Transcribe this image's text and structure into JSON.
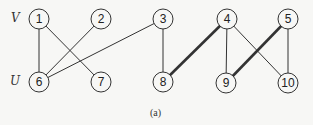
{
  "graph": {
    "set_labels": {
      "top": "V",
      "bottom": "U"
    },
    "caption": "(a)",
    "colors": {
      "stroke": "#333333",
      "node_fill": "#f7f7f5",
      "text": "#222222"
    },
    "nodes": [
      {
        "id": "1",
        "x": 39,
        "y": 19,
        "set": "V"
      },
      {
        "id": "2",
        "x": 101,
        "y": 19,
        "set": "V"
      },
      {
        "id": "3",
        "x": 163,
        "y": 19,
        "set": "V"
      },
      {
        "id": "4",
        "x": 227,
        "y": 19,
        "set": "V"
      },
      {
        "id": "5",
        "x": 288,
        "y": 19,
        "set": "V"
      },
      {
        "id": "6",
        "x": 39,
        "y": 82,
        "set": "U"
      },
      {
        "id": "7",
        "x": 101,
        "y": 82,
        "set": "U"
      },
      {
        "id": "8",
        "x": 163,
        "y": 82,
        "set": "U"
      },
      {
        "id": "9",
        "x": 226,
        "y": 83,
        "set": "U"
      },
      {
        "id": "10",
        "x": 288,
        "y": 83,
        "set": "U"
      }
    ],
    "edges": [
      {
        "from": "1",
        "to": "6",
        "bold": false
      },
      {
        "from": "1",
        "to": "7",
        "bold": false
      },
      {
        "from": "2",
        "to": "6",
        "bold": false
      },
      {
        "from": "3",
        "to": "6",
        "bold": false
      },
      {
        "from": "3",
        "to": "8",
        "bold": false
      },
      {
        "from": "4",
        "to": "8",
        "bold": true
      },
      {
        "from": "4",
        "to": "9",
        "bold": false
      },
      {
        "from": "4",
        "to": "10",
        "bold": false
      },
      {
        "from": "5",
        "to": "9",
        "bold": true
      },
      {
        "from": "5",
        "to": "10",
        "bold": false
      }
    ]
  }
}
